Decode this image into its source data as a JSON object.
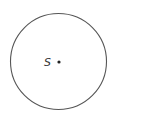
{
  "diagram": {
    "type": "circle",
    "circle": {
      "cx": 58.5,
      "cy": 61.5,
      "r": 48,
      "stroke": "#555555",
      "stroke_width": 1.1
    },
    "center_point": {
      "x": 59,
      "y": 62,
      "r": 1.6,
      "color": "#222222"
    },
    "center_label": {
      "text": "S",
      "x": 44,
      "y": 65.5
    }
  }
}
